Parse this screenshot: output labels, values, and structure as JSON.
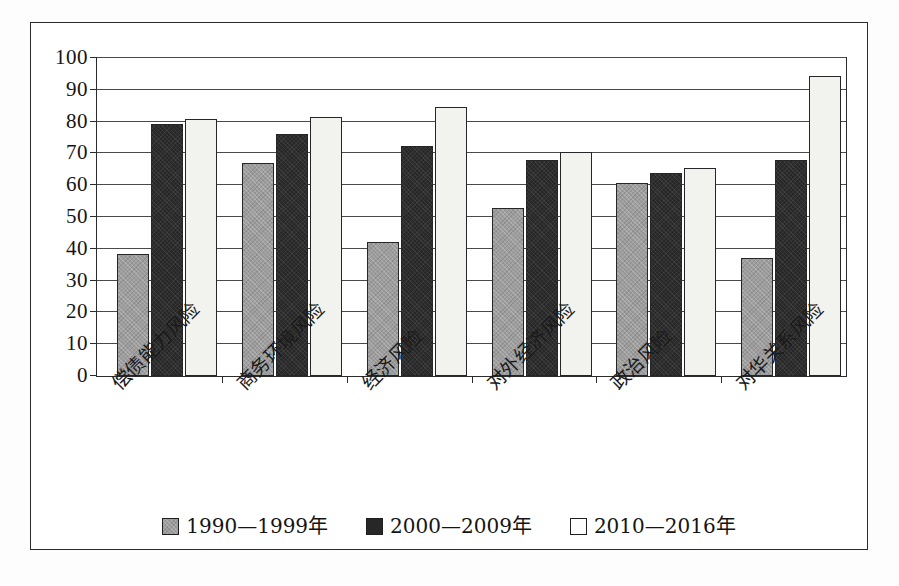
{
  "chart_data": {
    "type": "bar",
    "title": "",
    "xlabel": "",
    "ylabel": "",
    "ylim": [
      0,
      100
    ],
    "yticks": [
      0,
      10,
      20,
      30,
      40,
      50,
      60,
      70,
      80,
      90,
      100
    ],
    "grid": true,
    "legend_position": "bottom-center",
    "categories": [
      "偿债能力风险",
      "商务环境风险",
      "经济风险",
      "对外经济风险",
      "政治风险",
      "对华关系风险"
    ],
    "series": [
      {
        "name": "1990—1999年",
        "color": "#9d9d9d",
        "values": [
          38.5,
          67.0,
          42.0,
          52.8,
          60.8,
          37.0
        ]
      },
      {
        "name": "2000—2009年",
        "color": "#272727",
        "values": [
          79.2,
          76.0,
          72.2,
          68.0,
          63.8,
          67.8
        ]
      },
      {
        "name": "2010—2016年",
        "color": "#f2f2ef",
        "values": [
          80.8,
          81.5,
          84.5,
          70.5,
          65.5,
          94.5
        ]
      }
    ]
  },
  "legend": {
    "entries": [
      {
        "label": "1990—1999年"
      },
      {
        "label": "2000—2009年"
      },
      {
        "label": "2010—2016年"
      }
    ]
  },
  "axis": {
    "y_tick_labels": [
      "100",
      "90",
      "80",
      "70",
      "60",
      "50",
      "40",
      "30",
      "20",
      "10",
      "0"
    ]
  }
}
